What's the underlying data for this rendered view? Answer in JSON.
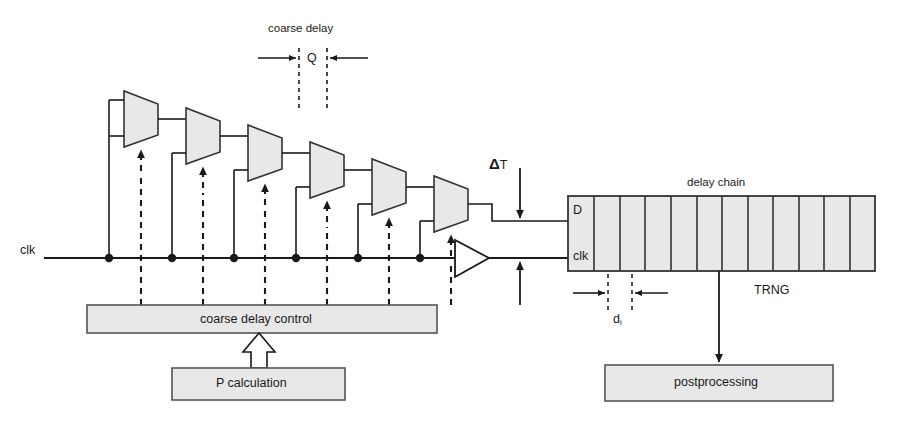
{
  "figure": {
    "type": "block-diagram",
    "background": "#ffffff",
    "line_color": "#1a1a1a",
    "block_fill": "#e8e8e8",
    "block_stroke": "#555555"
  },
  "labels": {
    "coarse_delay": "coarse delay",
    "q": "Q",
    "delta_t": "Δ",
    "delta_t_sub": "T",
    "clk_input": "clk",
    "delay_chain": "delay chain",
    "pin_d": "D",
    "pin_clk": "clk",
    "d_i_base": "d",
    "d_i_sub": "i",
    "trng": "TRNG"
  },
  "blocks": {
    "coarse_delay_control": "coarse delay control",
    "p_calculation": "P calculation",
    "postprocessing": "postprocessing"
  },
  "mux_chain": {
    "count": 6,
    "element": "multiplexer",
    "select_signal": "coarse delay control",
    "tap_count": 6
  },
  "delay_chain": {
    "cells": 12,
    "output_label": "TRNG",
    "feeds": "postprocessing"
  }
}
